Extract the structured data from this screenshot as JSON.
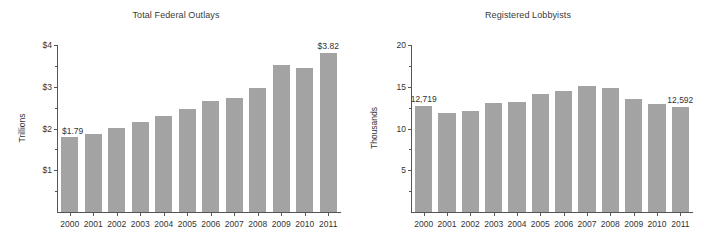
{
  "figure": {
    "panels": [
      {
        "key": "outlays",
        "title": "Total Federal Outlays",
        "ylabel": "Trillions"
      },
      {
        "key": "lobbyists",
        "title": "Registered Lobbyists",
        "ylabel": "Thousands"
      }
    ]
  },
  "chart_data": [
    {
      "type": "bar",
      "title": "Total Federal Outlays",
      "xlabel": "",
      "ylabel": "Trillions",
      "categories": [
        "2000",
        "2001",
        "2002",
        "2003",
        "2004",
        "2005",
        "2006",
        "2007",
        "2008",
        "2009",
        "2010",
        "2011"
      ],
      "values": [
        1.79,
        1.86,
        2.01,
        2.16,
        2.29,
        2.47,
        2.66,
        2.73,
        2.98,
        3.52,
        3.46,
        3.82
      ],
      "ylim": [
        0,
        4
      ],
      "yticks": [
        1,
        2,
        3,
        4
      ],
      "ytick_labels": [
        "$1",
        "$2",
        "$3",
        "$4"
      ],
      "yticks_minor": [
        0.5,
        1.5,
        2.5,
        3.5
      ],
      "grid": false,
      "legend": "none",
      "annotations": [
        {
          "category": "2000",
          "text": "$1.79",
          "position": "left-of-bar-top"
        },
        {
          "category": "2011",
          "text": "$3.82",
          "position": "above-bar-top"
        }
      ],
      "bar_color": "#a3a3a3"
    },
    {
      "type": "bar",
      "title": "Registered Lobbyists",
      "xlabel": "",
      "ylabel": "Thousands",
      "categories": [
        "2000",
        "2001",
        "2002",
        "2003",
        "2004",
        "2005",
        "2006",
        "2007",
        "2008",
        "2009",
        "2010",
        "2011"
      ],
      "values": [
        12.719,
        11.84,
        12.13,
        13.0,
        13.2,
        14.1,
        14.5,
        15.1,
        14.8,
        13.5,
        12.9,
        12.592
      ],
      "ylim": [
        0,
        20
      ],
      "yticks": [
        5,
        10,
        15,
        20
      ],
      "ytick_labels": [
        "5",
        "10",
        "15",
        "20"
      ],
      "yticks_minor": [
        2.5,
        7.5,
        12.5,
        17.5
      ],
      "grid": false,
      "legend": "none",
      "annotations": [
        {
          "category": "2000",
          "text": "12,719",
          "position": "above-bar-top"
        },
        {
          "category": "2011",
          "text": "12,592",
          "position": "above-bar-top"
        }
      ],
      "bar_color": "#a3a3a3"
    }
  ]
}
